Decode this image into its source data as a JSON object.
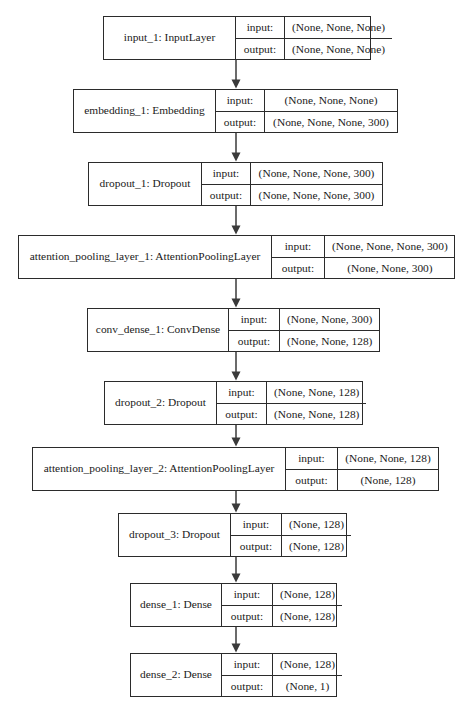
{
  "diagram": {
    "kind": "keras-model-plot",
    "canvas": {
      "width": 471,
      "height": 711
    },
    "style": {
      "background": "#ffffff",
      "border_color": "#2b2b2b",
      "text_color": "#1a1a1a",
      "arrow_color": "#3a3a3a"
    },
    "row_labels": {
      "input": "input:",
      "output": "output:"
    },
    "nodes": [
      {
        "id": "input_1",
        "name": "input_1: InputLayer",
        "input": "(None, None, None)",
        "output": "(None, None, None)",
        "box": {
          "x": 103,
          "y": 16,
          "width": 268,
          "height": 44
        },
        "name_width": 131,
        "label_width": 49
      },
      {
        "id": "embedding_1",
        "name": "embedding_1: Embedding",
        "input": "(None, None, None)",
        "output": "(None, None, None, 300)",
        "box": {
          "x": 73,
          "y": 89,
          "width": 325,
          "height": 44
        },
        "name_width": 141,
        "label_width": 49
      },
      {
        "id": "dropout_1",
        "name": "dropout_1: Dropout",
        "input": "(None, None, None, 300)",
        "output": "(None, None, None, 300)",
        "box": {
          "x": 88,
          "y": 162,
          "width": 295,
          "height": 44
        },
        "name_width": 112,
        "label_width": 49
      },
      {
        "id": "attention_pooling_layer_1",
        "name": "attention_pooling_layer_1: AttentionPoolingLayer",
        "input": "(None, None, None, 300)",
        "output": "(None, None, 300)",
        "box": {
          "x": 18,
          "y": 235,
          "width": 437,
          "height": 44
        },
        "name_width": 252,
        "label_width": 53
      },
      {
        "id": "conv_dense_1",
        "name": "conv_dense_1: ConvDense",
        "input": "(None, None, 300)",
        "output": "(None, None, 128)",
        "box": {
          "x": 87,
          "y": 308,
          "width": 293,
          "height": 44
        },
        "name_width": 140,
        "label_width": 51
      },
      {
        "id": "dropout_2",
        "name": "dropout_2: Dropout",
        "input": "(None, None, 128)",
        "output": "(None, None, 128)",
        "box": {
          "x": 104,
          "y": 381,
          "width": 259,
          "height": 44
        },
        "name_width": 111,
        "label_width": 50
      },
      {
        "id": "attention_pooling_layer_2",
        "name": "attention_pooling_layer_2: AttentionPoolingLayer",
        "input": "(None, None, 128)",
        "output": "(None, 128)",
        "box": {
          "x": 32,
          "y": 447,
          "width": 407,
          "height": 44
        },
        "name_width": 252,
        "label_width": 52
      },
      {
        "id": "dropout_3",
        "name": "dropout_3: Dropout",
        "input": "(None, 128)",
        "output": "(None, 128)",
        "box": {
          "x": 118,
          "y": 513,
          "width": 229,
          "height": 44
        },
        "name_width": 111,
        "label_width": 51
      },
      {
        "id": "dense_1",
        "name": "dense_1: Dense",
        "input": "(None, 128)",
        "output": "(None, 128)",
        "box": {
          "x": 130,
          "y": 583,
          "width": 207,
          "height": 44
        },
        "name_width": 90,
        "label_width": 51
      },
      {
        "id": "dense_2",
        "name": "dense_2: Dense",
        "input": "(None, 128)",
        "output": "(None, 1)",
        "box": {
          "x": 130,
          "y": 653,
          "width": 207,
          "height": 44
        },
        "name_width": 90,
        "label_width": 51
      }
    ],
    "edges": [
      {
        "from": "input_1",
        "to": "embedding_1",
        "x": 236,
        "y1": 60,
        "y2": 89
      },
      {
        "from": "embedding_1",
        "to": "dropout_1",
        "x": 236,
        "y1": 133,
        "y2": 162
      },
      {
        "from": "dropout_1",
        "to": "attention_pooling_layer_1",
        "x": 236,
        "y1": 206,
        "y2": 235
      },
      {
        "from": "attention_pooling_layer_1",
        "to": "conv_dense_1",
        "x": 236,
        "y1": 279,
        "y2": 308
      },
      {
        "from": "conv_dense_1",
        "to": "dropout_2",
        "x": 236,
        "y1": 352,
        "y2": 381
      },
      {
        "from": "dropout_2",
        "to": "attention_pooling_layer_2",
        "x": 236,
        "y1": 425,
        "y2": 447
      },
      {
        "from": "attention_pooling_layer_2",
        "to": "dropout_3",
        "x": 236,
        "y1": 491,
        "y2": 513
      },
      {
        "from": "dropout_3",
        "to": "dense_1",
        "x": 236,
        "y1": 557,
        "y2": 583
      },
      {
        "from": "dense_1",
        "to": "dense_2",
        "x": 236,
        "y1": 627,
        "y2": 653
      }
    ]
  }
}
